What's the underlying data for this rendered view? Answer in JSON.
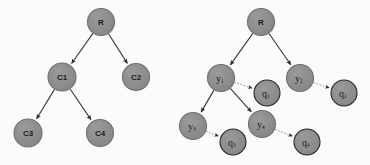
{
  "figure": {
    "background_color": "#fbfbfa",
    "node_fill": "#8c8c8c",
    "node_stroke": "#6f6f6f",
    "q_node_fill": "#8a8a8a",
    "q_node_stroke": "#272727",
    "edge_color": "#3c3c3c",
    "dotted_edge_color": "#8e8e8e",
    "label_color": "#1b1b1b"
  },
  "diagrams": [
    {
      "id": "left-tree",
      "name": "class-hierarchy-tree",
      "nodes": [
        {
          "id": "L-R",
          "label": "R",
          "sub": "",
          "x": 101,
          "y": 22,
          "r": 13.5,
          "style": "plain",
          "bold": true,
          "font_size": 8
        },
        {
          "id": "L-C1",
          "label": "C1",
          "sub": "",
          "x": 62,
          "y": 77,
          "r": 14.0,
          "style": "plain",
          "bold": true,
          "font_size": 8
        },
        {
          "id": "L-C2",
          "label": "C2",
          "sub": "",
          "x": 136,
          "y": 77,
          "r": 13.5,
          "style": "plain",
          "bold": true,
          "font_size": 8
        },
        {
          "id": "L-C3",
          "label": "C3",
          "sub": "",
          "x": 28,
          "y": 133,
          "r": 14.0,
          "style": "plain",
          "bold": true,
          "font_size": 8
        },
        {
          "id": "L-C4",
          "label": "C4",
          "sub": "",
          "x": 100,
          "y": 133,
          "r": 13.5,
          "style": "plain",
          "bold": true,
          "font_size": 8
        }
      ],
      "edges": [
        {
          "from": "L-R",
          "to": "L-C1",
          "type": "solid",
          "arrow": true
        },
        {
          "from": "L-R",
          "to": "L-C2",
          "type": "solid",
          "arrow": true
        },
        {
          "from": "L-C1",
          "to": "L-C3",
          "type": "solid",
          "arrow": true
        },
        {
          "from": "L-C1",
          "to": "L-C4",
          "type": "solid",
          "arrow": true
        }
      ]
    },
    {
      "id": "right-tree",
      "name": "instance-query-tree",
      "nodes": [
        {
          "id": "R-R",
          "label": "R",
          "sub": "",
          "x": 261,
          "y": 22,
          "r": 13.5,
          "style": "plain",
          "bold": true,
          "font_size": 8
        },
        {
          "id": "R-y1",
          "label": "y",
          "sub": "1",
          "x": 221,
          "y": 78,
          "r": 13.5,
          "style": "plain",
          "bold": false,
          "font_size": 10
        },
        {
          "id": "R-y2",
          "label": "y",
          "sub": "2",
          "x": 300,
          "y": 78,
          "r": 13.5,
          "style": "plain",
          "bold": false,
          "font_size": 10
        },
        {
          "id": "R-q1",
          "label": "q",
          "sub": "1",
          "x": 267,
          "y": 93,
          "r": 13.0,
          "style": "ring",
          "bold": false,
          "font_size": 10
        },
        {
          "id": "R-q2",
          "label": "q",
          "sub": "2",
          "x": 344,
          "y": 93,
          "r": 13.0,
          "style": "ring",
          "bold": false,
          "font_size": 10
        },
        {
          "id": "R-y3",
          "label": "y",
          "sub": "3",
          "x": 193,
          "y": 126,
          "r": 13.5,
          "style": "plain",
          "bold": false,
          "font_size": 10
        },
        {
          "id": "R-y4",
          "label": "y",
          "sub": "4",
          "x": 262,
          "y": 124,
          "r": 13.5,
          "style": "plain",
          "bold": false,
          "font_size": 10
        },
        {
          "id": "R-q3",
          "label": "q",
          "sub": "3",
          "x": 233,
          "y": 142,
          "r": 13.0,
          "style": "ring",
          "bold": false,
          "font_size": 10
        },
        {
          "id": "R-q4",
          "label": "q",
          "sub": "4",
          "x": 307,
          "y": 142,
          "r": 13.0,
          "style": "ring",
          "bold": false,
          "font_size": 10
        }
      ],
      "edges": [
        {
          "from": "R-R",
          "to": "R-y1",
          "type": "solid",
          "arrow": true
        },
        {
          "from": "R-R",
          "to": "R-y2",
          "type": "solid",
          "arrow": true
        },
        {
          "from": "R-y1",
          "to": "R-y3",
          "type": "solid",
          "arrow": true
        },
        {
          "from": "R-y1",
          "to": "R-y4",
          "type": "solid",
          "arrow": true
        },
        {
          "from": "R-y1",
          "to": "R-q1",
          "type": "dotted",
          "arrow": true
        },
        {
          "from": "R-y2",
          "to": "R-q2",
          "type": "dotted",
          "arrow": true
        },
        {
          "from": "R-y3",
          "to": "R-q3",
          "type": "dotted",
          "arrow": true
        },
        {
          "from": "R-y4",
          "to": "R-q4",
          "type": "dotted",
          "arrow": true
        }
      ]
    }
  ]
}
